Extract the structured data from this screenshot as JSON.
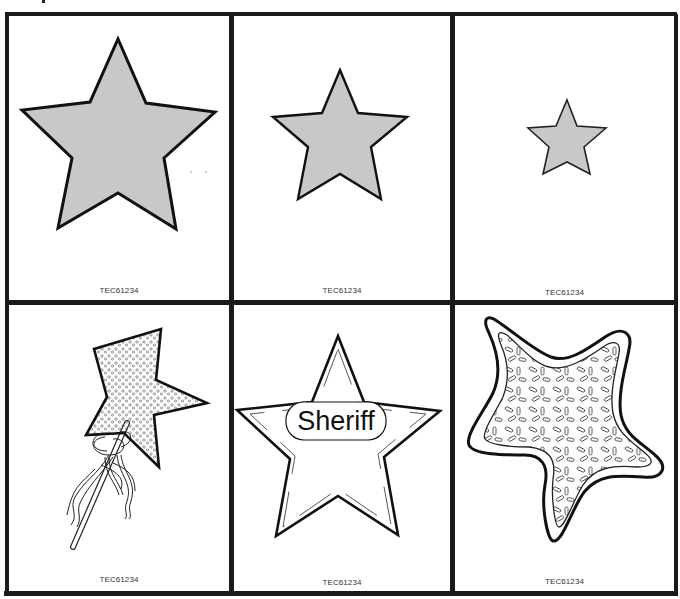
{
  "sheet": {
    "title": "Star pattern cards",
    "cards": [
      {
        "id": "large-star",
        "description": "Large gray star",
        "code": "TEC61234"
      },
      {
        "id": "medium-star",
        "description": "Medium gray star",
        "code": "TEC61234"
      },
      {
        "id": "small-star",
        "description": "Small gray star",
        "code": "TEC61234"
      },
      {
        "id": "magic-wand",
        "description": "Sparkly star magic wand with ribbons",
        "code": "TEC61234"
      },
      {
        "id": "sheriff-badge",
        "description": "Sheriff star badge",
        "code": "TEC61234",
        "badge_text": "Sheriff"
      },
      {
        "id": "star-cookie",
        "description": "Star cookie with sprinkles",
        "code": "TEC61234"
      }
    ]
  },
  "colors": {
    "border": "#1a1a1a",
    "star_fill": "#c8c8c8",
    "background": "#ffffff"
  }
}
